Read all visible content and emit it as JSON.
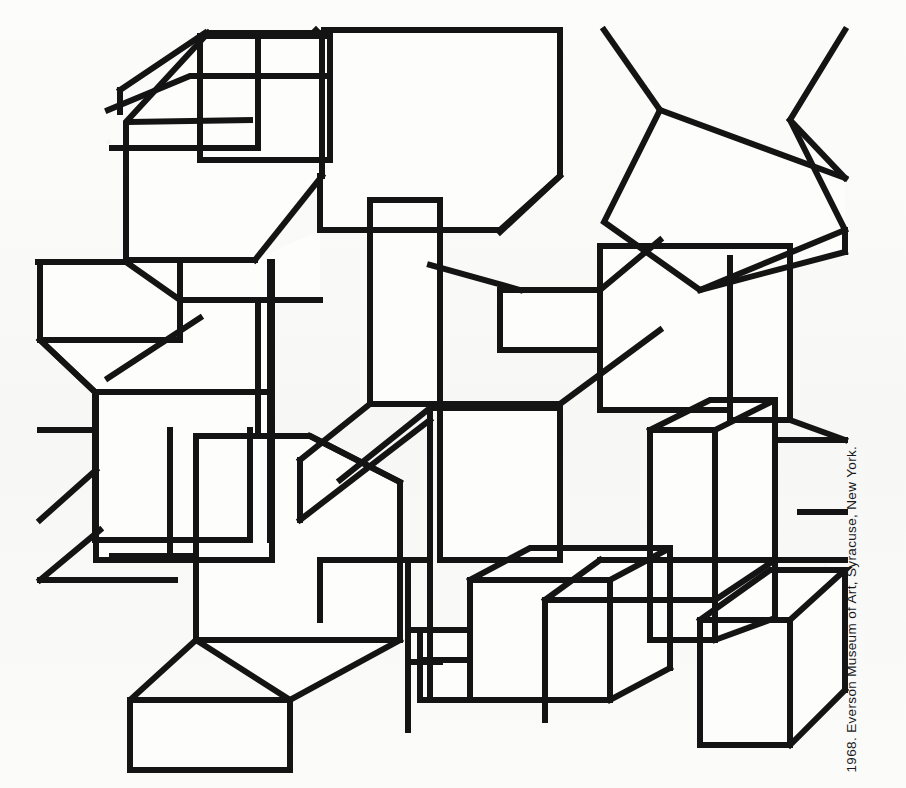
{
  "plate": {
    "caption": "1968. Everson Museum of Art, Syracuse, New York.",
    "medium_description": "Isometric line drawing of interlocking open rectangular boxes",
    "ink_color": "#141414",
    "paper_color": "#fbfbfa",
    "stroke_width_px": 6
  },
  "artwork": {
    "title_alt": "Untitled isometric box composition",
    "line_color": "#141414",
    "fill_color": "#fdfdfc",
    "canvas": {
      "width": 906,
      "height": 788
    },
    "polylines": [
      "M 108,378 L 200,318",
      "M 108,110 L 190,76 L 330,76",
      "M 112,148 L 258,148 L 258,36",
      "M 112,148 L 258,148",
      "M 200,36 L 330,36 L 330,160 L 200,160 Z",
      "M 205,34 L 330,34",
      "M 130,122 L 250,120",
      "M 208,33 L 322,33 L 322,34",
      "M 205,33 L 120,90",
      "M 120,90 L 120,112",
      "M 322,33 L 322,176",
      "M 208,33 L 126,122 L 126,260 L 255,260",
      "M 255,260 L 322,176",
      "M 316,30 L 322,36",
      "M 324,30 L 560,30 L 560,176 L 500,230 L 320,230",
      "M 560,30 L 324,30",
      "M 560,176 L 500,232",
      "M 320,230 L 320,176",
      "M 40,262 L 130,262",
      "M 40,262 L 40,340 L 180,340 L 180,262",
      "M 40,340 L 95,392 L 270,392 L 270,262",
      "M 95,392 L 95,540",
      "M 270,392 L 270,540",
      "M 95,540 L 250,540",
      "M 250,540 L 250,430",
      "M 40,340 L 40,262",
      "M 38,262 L 126,262",
      "M 126,262 L 180,300 L 320,300",
      "M 180,300 L 180,340",
      "M 95,392 L 40,340",
      "M 96,392 L 272,392",
      "M 272,392 L 272,262",
      "M 272,392 L 272,560",
      "M 96,392 L 96,560",
      "M 96,560 L 272,560",
      "M 40,430 L 96,430",
      "M 96,470 L 40,520",
      "M 170,430 L 170,560",
      "M 196,436 L 310,436 L 400,482 L 400,640 L 196,640 Z",
      "M 196,436 L 196,640",
      "M 310,436 L 400,482",
      "M 196,640 L 130,700 L 130,770 L 290,770 L 290,700 Z",
      "M 290,700 L 400,640",
      "M 130,700 L 290,700",
      "M 290,700 L 290,770",
      "M 40,580 L 175,580",
      "M 40,580 L 100,530",
      "M 112,556 L 196,556",
      "M 258,430 L 258,300",
      "M 370,200 L 440,200 L 440,404 L 370,404 Z",
      "M 370,200 L 370,404",
      "M 440,200 L 440,404",
      "M 430,265 L 520,290",
      "M 440,404 L 560,404",
      "M 560,404 L 560,560",
      "M 440,404 L 440,560",
      "M 440,560 L 560,560",
      "M 500,290 L 600,290 L 600,400",
      "M 500,290 L 500,350",
      "M 500,350 L 600,350",
      "M 600,290 L 660,240",
      "M 560,404 L 660,330",
      "M 340,480 L 430,408",
      "M 430,408 L 560,408",
      "M 300,520 L 430,420",
      "M 370,404 L 300,460",
      "M 300,460 L 300,520",
      "M 430,404 L 430,700",
      "M 430,700 L 560,700",
      "M 320,560 L 430,560",
      "M 320,560 L 320,620",
      "M 604,30 L 660,110",
      "M 660,110 L 604,222 L 700,290 L 845,230 L 790,120 L 845,30",
      "M 660,110 L 845,178",
      "M 845,178 L 790,120",
      "M 700,290 L 845,252",
      "M 845,252 L 845,230",
      "M 730,258 L 730,420",
      "M 600,246 L 790,246",
      "M 600,246 L 600,410",
      "M 600,410 L 730,410",
      "M 790,246 L 790,420",
      "M 730,420 L 790,420",
      "M 650,430 L 715,430 L 715,640 L 650,640 Z",
      "M 650,430 L 650,640",
      "M 715,430 L 715,640",
      "M 650,430 L 710,400 L 775,400 L 715,430",
      "M 775,400 L 775,618",
      "M 715,640 L 775,618",
      "M 775,440 L 845,440",
      "M 790,420 L 845,440",
      "M 600,560 L 720,560 L 845,560",
      "M 600,560 L 545,600",
      "M 545,600 L 545,720",
      "M 545,600 L 715,600",
      "M 715,600 L 775,560",
      "M 470,580 L 610,580 L 610,700 L 470,700 Z",
      "M 470,580 L 470,700",
      "M 610,580 L 610,700",
      "M 470,580 L 530,548 L 670,548 L 610,580",
      "M 670,548 L 670,668",
      "M 610,700 L 670,668",
      "M 420,630 L 470,630",
      "M 420,630 L 420,700 L 470,700",
      "M 420,660 L 470,660",
      "M 420,660 L 420,700",
      "M 408,560 L 408,730",
      "M 408,630 L 470,630",
      "M 408,662 L 440,662",
      "M 700,620 L 790,620 L 790,745 L 700,745 Z",
      "M 700,620 L 700,745",
      "M 790,620 L 790,745",
      "M 700,620 L 770,570 L 845,570 L 790,620",
      "M 845,570 L 845,690",
      "M 790,745 L 845,690",
      "M 800,512 L 845,512"
    ]
  }
}
